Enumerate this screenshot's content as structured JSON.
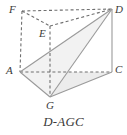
{
  "figure": {
    "caption": "D-AGC",
    "shape_type": "triangular-prism",
    "styles": {
      "solid_edge_color": "#9a9a9a",
      "hidden_edge_color": "#6f6f6f",
      "face_fill_color": "#ececec",
      "label_color": "#3a3a3a",
      "background_color": "#ffffff",
      "stroke_width": 1.1,
      "dash_pattern": "3,2.4"
    },
    "vertices": [
      {
        "id": "F",
        "label": "F",
        "x": 22,
        "y": 11,
        "label_x": 9,
        "label_y": 4,
        "hidden": true
      },
      {
        "id": "E",
        "label": "E",
        "x": 50,
        "y": 26,
        "label_x": 39,
        "label_y": 28,
        "hidden": true
      },
      {
        "id": "D",
        "label": "D",
        "x": 112,
        "y": 9,
        "label_x": 115,
        "label_y": 4,
        "hidden": false
      },
      {
        "id": "A",
        "label": "A",
        "x": 20,
        "y": 72,
        "label_x": 6,
        "label_y": 65,
        "hidden": false
      },
      {
        "id": "G",
        "label": "G",
        "x": 50,
        "y": 97,
        "label_x": 46,
        "label_y": 100,
        "hidden": false
      },
      {
        "id": "C",
        "label": "C",
        "x": 112,
        "y": 72,
        "label_x": 115,
        "label_y": 64,
        "hidden": false
      }
    ],
    "faces": [
      {
        "id": "base-AGC",
        "name": "base-triangle-agc",
        "points": "20,72 50,97 112,72",
        "fill": "#ececec"
      },
      {
        "id": "face-AGD",
        "name": "face-agd",
        "points": "20,72 50,97 112,9",
        "fill": "#f2f2f2"
      }
    ],
    "edges": [
      {
        "id": "FD",
        "name": "edge-f-d",
        "from": "F",
        "to": "D",
        "style": "dashed"
      },
      {
        "id": "FE",
        "name": "edge-f-e",
        "from": "F",
        "to": "E",
        "style": "dashed"
      },
      {
        "id": "ED",
        "name": "edge-e-d",
        "from": "E",
        "to": "D",
        "style": "dashed"
      },
      {
        "id": "FA",
        "name": "edge-f-a",
        "from": "F",
        "to": "A",
        "style": "dashed"
      },
      {
        "id": "EG",
        "name": "edge-e-g",
        "from": "E",
        "to": "G",
        "style": "dashed"
      },
      {
        "id": "AC",
        "name": "edge-a-c",
        "from": "A",
        "to": "C",
        "style": "dashed"
      },
      {
        "id": "AG",
        "name": "edge-a-g",
        "from": "A",
        "to": "G",
        "style": "solid"
      },
      {
        "id": "GC",
        "name": "edge-g-c",
        "from": "G",
        "to": "C",
        "style": "solid"
      },
      {
        "id": "DC",
        "name": "edge-d-c",
        "from": "D",
        "to": "C",
        "style": "solid"
      },
      {
        "id": "AD",
        "name": "edge-a-d",
        "from": "A",
        "to": "D",
        "style": "solid"
      },
      {
        "id": "GD",
        "name": "edge-g-d",
        "from": "G",
        "to": "D",
        "style": "solid"
      }
    ]
  }
}
